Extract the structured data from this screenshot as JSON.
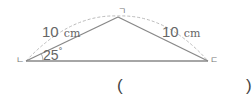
{
  "diagram": {
    "type": "isosceles-triangle",
    "vertices": {
      "top": "ㄱ",
      "left": "ㄴ",
      "right": "ㄷ"
    },
    "sides": {
      "left_side": {
        "value": "10",
        "unit": "cm"
      },
      "right_side": {
        "value": "10",
        "unit": "cm"
      }
    },
    "angle": {
      "value": "25",
      "unit": "°"
    },
    "answer": {
      "open": "(",
      "close": ")"
    }
  },
  "colors": {
    "line": "#888888",
    "arc": "#bbbbbb",
    "text": "#666666"
  }
}
